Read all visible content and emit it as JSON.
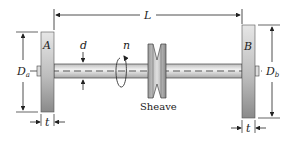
{
  "diagram": {
    "type": "shaft assembly",
    "labels": {
      "length": "L",
      "disc_a": "A",
      "disc_b": "B",
      "shaft_diameter": "d",
      "speed": "n",
      "diameter_a_main": "D",
      "diameter_a_sub": "a",
      "diameter_b_main": "D",
      "diameter_b_sub": "b",
      "thickness_a": "t",
      "thickness_b": "t",
      "sheave": "Sheave"
    },
    "colors": {
      "line": "#222222",
      "disc_light": "#e4e4e4",
      "disc_dark": "#8c8c8c",
      "shaft": "#d8d8d8"
    }
  }
}
